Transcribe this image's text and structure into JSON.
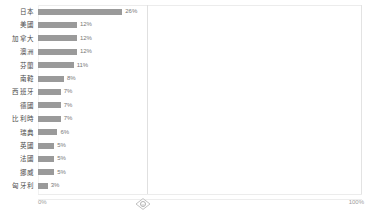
{
  "chart_data": {
    "type": "bar",
    "orientation": "horizontal",
    "title": "",
    "xlabel": "",
    "ylabel": "",
    "xlim": [
      0,
      100
    ],
    "grid": false,
    "legend": false,
    "categories": [
      "日本",
      "美國",
      "加拿大",
      "澳洲",
      "芬蘭",
      "南韓",
      "西班牙",
      "德國",
      "比利時",
      "瑞典",
      "英國",
      "法國",
      "挪威",
      "匈牙利"
    ],
    "values": [
      26,
      12,
      12,
      12,
      11,
      8,
      7,
      7,
      7,
      6,
      5,
      5,
      5,
      3
    ],
    "value_labels": [
      "26%",
      "12%",
      "12%",
      "12%",
      "11%",
      "8%",
      "7%",
      "7%",
      "7%",
      "6%",
      "5%",
      "5%",
      "5%",
      "3%"
    ],
    "bar_color": "#9a9a9a",
    "axis_ticks": [
      "0%",
      "100%"
    ]
  },
  "rows": [
    {
      "label": "日本",
      "value": 26,
      "value_label": "26%"
    },
    {
      "label": "美國",
      "value": 12,
      "value_label": "12%"
    },
    {
      "label": "加拿大",
      "value": 12,
      "value_label": "12%"
    },
    {
      "label": "澳洲",
      "value": 12,
      "value_label": "12%"
    },
    {
      "label": "芬蘭",
      "value": 11,
      "value_label": "11%"
    },
    {
      "label": "南韓",
      "value": 8,
      "value_label": "8%"
    },
    {
      "label": "西班牙",
      "value": 7,
      "value_label": "7%"
    },
    {
      "label": "德國",
      "value": 7,
      "value_label": "7%"
    },
    {
      "label": "比利時",
      "value": 7,
      "value_label": "7%"
    },
    {
      "label": "瑞典",
      "value": 6,
      "value_label": "6%"
    },
    {
      "label": "英國",
      "value": 5,
      "value_label": "5%"
    },
    {
      "label": "法國",
      "value": 5,
      "value_label": "5%"
    },
    {
      "label": "挪威",
      "value": 5,
      "value_label": "5%"
    },
    {
      "label": "匈牙利",
      "value": 3,
      "value_label": "3%"
    }
  ],
  "axis": {
    "min_label": "0%",
    "max_label": "100%"
  },
  "handle": {
    "name": "column-resize-handle"
  },
  "colors": {
    "bar": "#9a9a9a",
    "label_text": "#4a4a4a",
    "value_text": "#777777",
    "axis_text": "#9c9c9c",
    "panel_border": "#e3e3e3"
  }
}
